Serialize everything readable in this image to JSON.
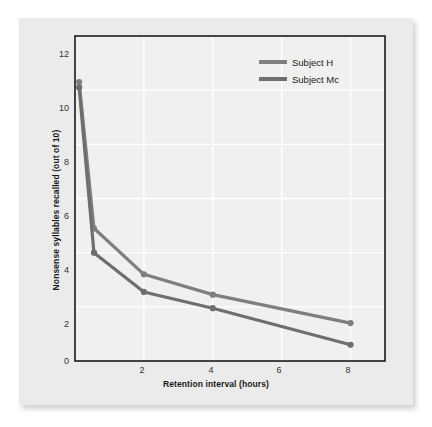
{
  "chart_data": {
    "type": "line",
    "title": "",
    "xlabel": "Retention interval (hours)",
    "ylabel": "Nonsense syllables recalled (out of 10)",
    "xlim": [
      0,
      9
    ],
    "ylim": [
      0,
      12
    ],
    "xticks": [
      "2",
      "4",
      "6",
      "8"
    ],
    "xtick_values": [
      2,
      4,
      6,
      8
    ],
    "yticks": [
      "0",
      "2",
      "4",
      "6",
      "8",
      "10",
      "12"
    ],
    "ytick_values": [
      0,
      2,
      4,
      6,
      8,
      10,
      12
    ],
    "grid": true,
    "grid_color": "#ffffff",
    "plot_background": "#f0f0f0",
    "frame_color": "#1a1a1a",
    "legend_position": "upper right",
    "series": [
      {
        "name": "Subject H",
        "color": "#7f7f7f",
        "x": [
          0.12,
          0.55,
          2,
          4,
          8
        ],
        "values": [
          10.3,
          4.9,
          3.2,
          2.45,
          1.4
        ]
      },
      {
        "name": "Subject Mc",
        "color": "#6e6e6e",
        "x": [
          0.12,
          0.55,
          2,
          4,
          8
        ],
        "values": [
          10.1,
          4.0,
          2.55,
          1.95,
          0.6
        ]
      }
    ]
  },
  "legend": {
    "items": [
      {
        "label": "Subject H"
      },
      {
        "label": "Subject Mc"
      }
    ]
  },
  "axes": {
    "x_title": "Retention interval (hours)",
    "y_title": "Nonsense syllables recalled (out of 10)",
    "y_tick_labels": [
      "12",
      "10",
      "8",
      "6",
      "4",
      "2",
      "0"
    ],
    "x_tick_labels": [
      "2",
      "4",
      "6",
      "8"
    ]
  }
}
